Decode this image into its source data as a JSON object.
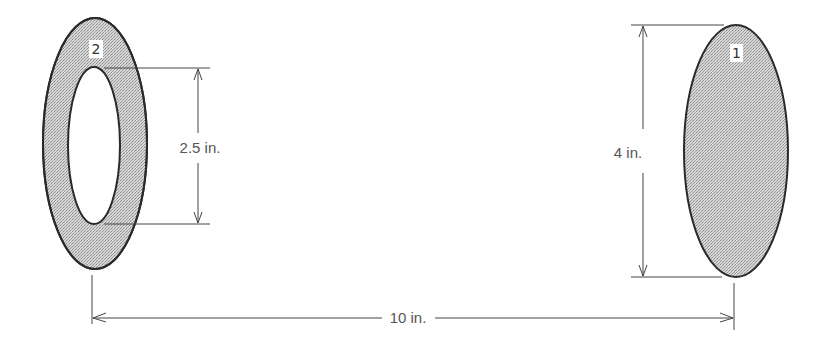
{
  "colors": {
    "outline": "#2a2a2a",
    "fill": "#c9c9c9",
    "dimension_line": "#444444",
    "text": "#555555",
    "background": "#ffffff"
  },
  "objects": [
    {
      "id": "object-1",
      "label": "1",
      "shape": "solid-ellipse",
      "description": "Solid elliptical disk"
    },
    {
      "id": "object-2",
      "label": "2",
      "shape": "elliptical-ring",
      "description": "Elliptical ring with elliptical hole"
    }
  ],
  "dimensions": {
    "inner_height": "2.5 in.",
    "outer_height": "4 in.",
    "separation": "10 in."
  }
}
